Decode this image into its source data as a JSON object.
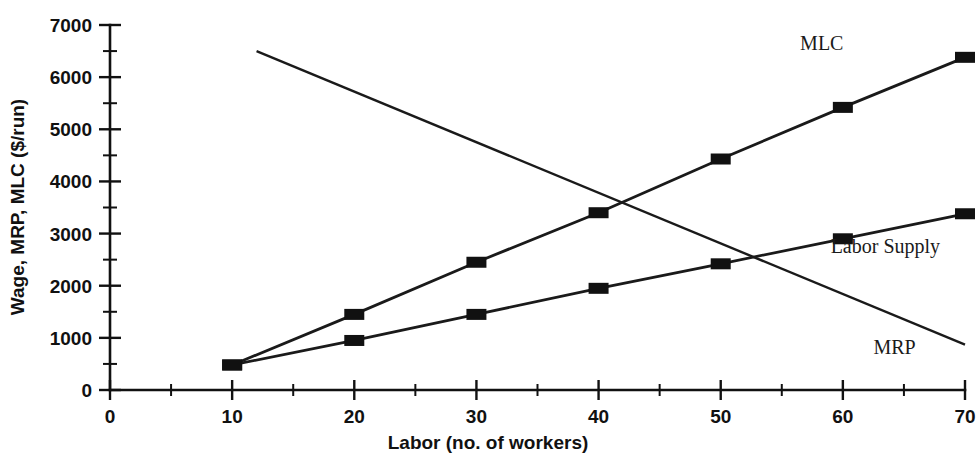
{
  "chart_data": {
    "type": "line",
    "title": "",
    "xlabel": "Labor (no. of workers)",
    "ylabel": "Wage, MRP, MLC ($/run)",
    "xlim": [
      0,
      70
    ],
    "ylim": [
      0,
      7000
    ],
    "x_ticks": [
      0,
      10,
      20,
      30,
      40,
      50,
      60,
      70
    ],
    "x_tick_labels": [
      "0",
      "10",
      "20",
      "30",
      "40",
      "50",
      "60",
      "70"
    ],
    "x_minor_ticks": [
      5,
      15,
      25,
      35,
      45,
      55,
      65
    ],
    "y_ticks": [
      0,
      1000,
      2000,
      3000,
      4000,
      5000,
      6000,
      7000
    ],
    "y_tick_labels": [
      "0",
      "1000",
      "2000",
      "3000",
      "4000",
      "5000",
      "6000",
      "7000"
    ],
    "y_minor_ticks": [
      500,
      1500,
      2500,
      3500,
      4500,
      5500,
      6500
    ],
    "grid": false,
    "legend_position": "inline-annotations",
    "marker_style": "filled-rectangle",
    "line_color": "#1a1a1a",
    "series": [
      {
        "name": "MLC",
        "label": "MLC",
        "label_x": 56.5,
        "label_y": 6520,
        "markers": true,
        "x": [
          10,
          20,
          30,
          40,
          50,
          60,
          70
        ],
        "values": [
          480,
          1450,
          2450,
          3400,
          4430,
          5420,
          6380
        ]
      },
      {
        "name": "Labor Supply",
        "label": "Labor Supply",
        "label_x": 59.0,
        "label_y": 2620,
        "markers": true,
        "x": [
          10,
          20,
          30,
          40,
          50,
          60,
          70
        ],
        "values": [
          480,
          950,
          1450,
          1950,
          2420,
          2900,
          3380
        ]
      },
      {
        "name": "MRP",
        "label": "MRP",
        "label_x": 62.5,
        "label_y": 690,
        "markers": false,
        "x": [
          12,
          70
        ],
        "values": [
          6500,
          870
        ]
      }
    ]
  }
}
